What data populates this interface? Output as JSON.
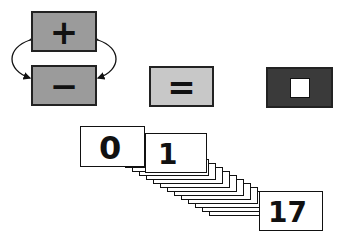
{
  "operators": {
    "plus": {
      "symbol": "+",
      "fill": "#9b9b9b"
    },
    "minus": {
      "symbol": "−",
      "fill": "#9b9b9b"
    },
    "equals": {
      "symbol": "=",
      "fill": "#c8c8c8"
    },
    "blank": {
      "symbol": "",
      "fill": "#3a3a3a",
      "inner_fill": "#ffffff"
    }
  },
  "cards": {
    "first": "0",
    "second": "1",
    "last": "17",
    "stack_count": 18
  }
}
